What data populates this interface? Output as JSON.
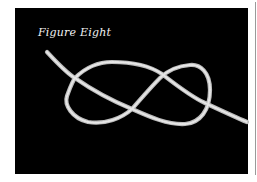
{
  "figure": {
    "caption": "Figure Eight",
    "colors": {
      "background": "#000000",
      "rope": "#d8d8d8",
      "caption": "#f2f2f2",
      "page": "#ffffff"
    }
  }
}
